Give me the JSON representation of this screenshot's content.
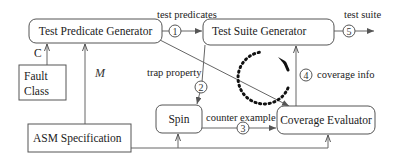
{
  "diagram": {
    "nodes": {
      "test_predicate_generator": "Test Predicate Generator",
      "test_suite_generator": "Test Suite Generator",
      "fault_class_line1": "Fault",
      "fault_class_line2": "Class",
      "asm_specification": "ASM Specification",
      "spin": "Spin",
      "coverage_evaluator": "Coverage Evaluator"
    },
    "edge_labels": {
      "test_predicates": "test predicates",
      "test_suite": "test suite",
      "trap_property": "trap property",
      "counter_example": "counter example",
      "coverage_info": "coverage info",
      "c": "C",
      "m": "M"
    },
    "step_numbers": [
      "1",
      "2",
      "3",
      "4",
      "5"
    ]
  }
}
